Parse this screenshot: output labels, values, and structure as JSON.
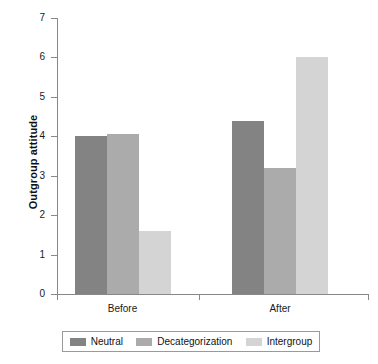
{
  "chart_data": {
    "type": "bar",
    "title": "",
    "xlabel": "",
    "ylabel": "Outgroup attitude",
    "categories": [
      "Before",
      "After"
    ],
    "series": [
      {
        "name": "Neutral",
        "color": "#838383",
        "values": [
          4.0,
          4.4
        ]
      },
      {
        "name": "Decategorization",
        "color": "#ababab",
        "values": [
          4.05,
          3.2
        ]
      },
      {
        "name": "Intergroup",
        "color": "#d4d4d4",
        "values": [
          1.6,
          6.0
        ]
      }
    ],
    "ylim": [
      0,
      7
    ],
    "yticks": [
      0,
      1,
      2,
      3,
      4,
      5,
      6,
      7
    ],
    "ytick_labels": [
      "0",
      "1",
      "2",
      "3",
      "4",
      "5",
      "6",
      "7"
    ],
    "grid": false,
    "legend_position": "bottom"
  },
  "axis": {
    "y_title": "Outgroup attitude"
  }
}
